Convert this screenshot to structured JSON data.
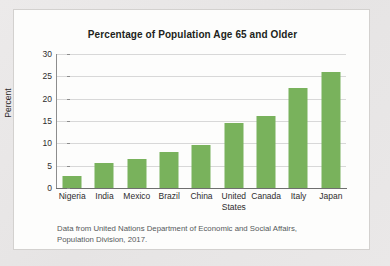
{
  "chart_data": {
    "type": "bar",
    "title": "Percentage of Population Age 65 and Older",
    "xlabel": "",
    "ylabel": "Percent",
    "categories": [
      "Nigeria",
      "India",
      "Mexico",
      "Brazil",
      "China",
      "United States",
      "Canada",
      "Italy",
      "Japan"
    ],
    "values": [
      2.7,
      5.6,
      6.5,
      8.0,
      9.7,
      14.6,
      16.1,
      22.3,
      25.9
    ],
    "ylim": [
      0,
      30
    ],
    "yticks": [
      0,
      5,
      10,
      15,
      20,
      25,
      30
    ],
    "ytick_labels": [
      "0",
      "5",
      "10",
      "15",
      "20",
      "25",
      "30"
    ],
    "grid": true,
    "legend": "none",
    "bar_color": "#79b25c",
    "source_note_line1": "Data from United Nations Department of Economic and Social Affairs,",
    "source_note_line2": "Population Division, 2017."
  }
}
